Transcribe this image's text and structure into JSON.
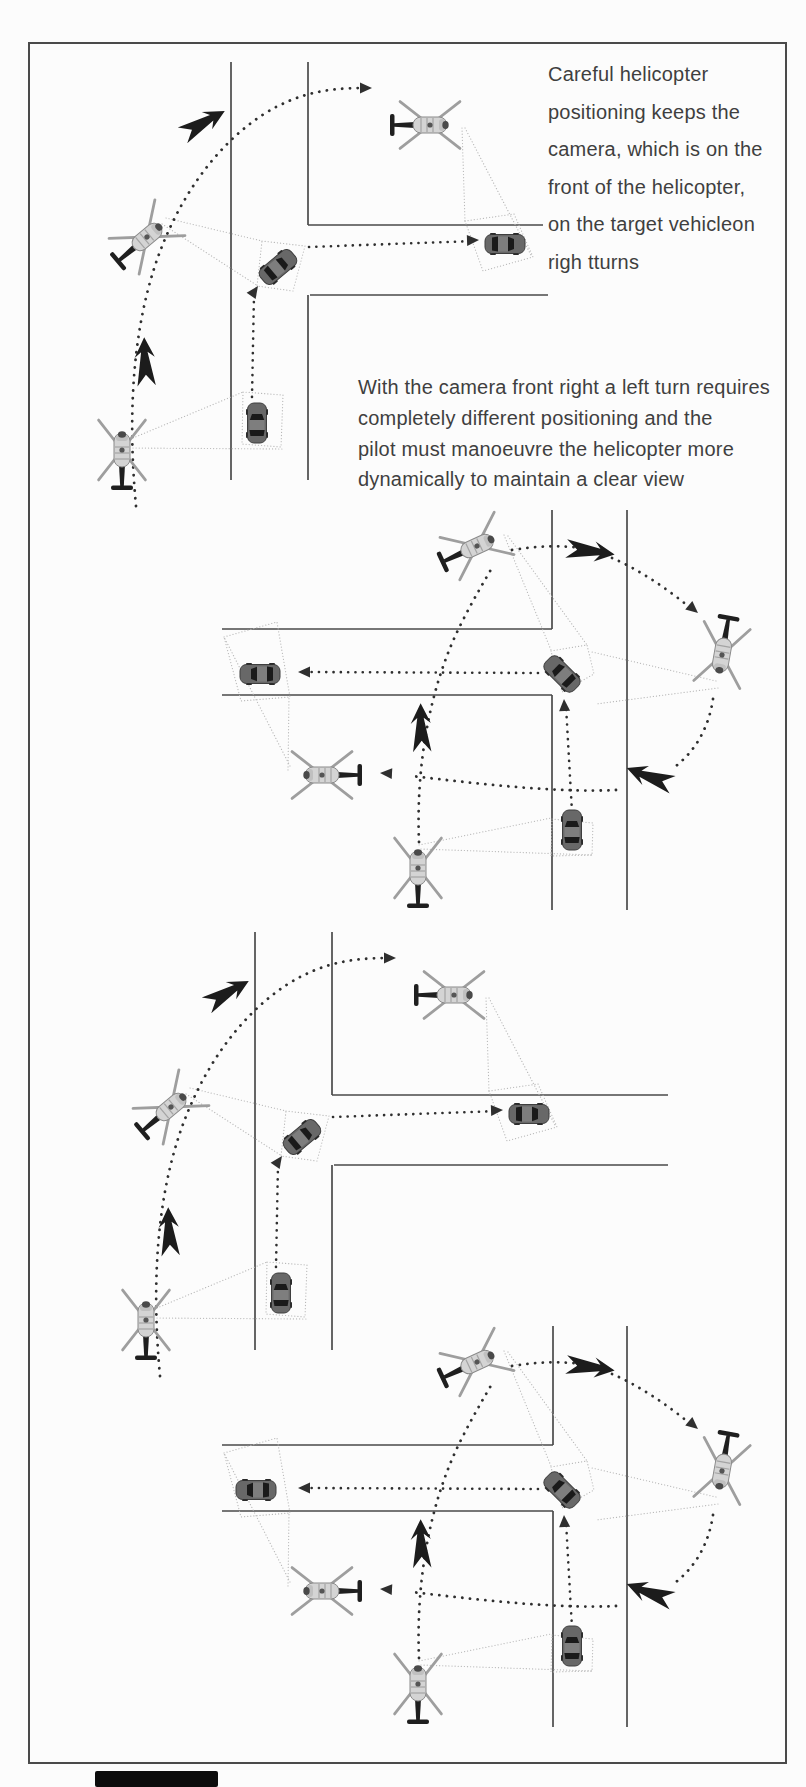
{
  "page": {
    "width": 806,
    "height": 1787,
    "background": "#fcfcfc",
    "frame_color": "#4a4a4a"
  },
  "captions": {
    "right_turn": {
      "text": "Careful helicopter\npositioning keeps the\ncamera, which is on the\nfront of the helicopter,\non the target vehicleon\nrigh tturns"
    },
    "left_turn": {
      "text": "With the camera front right a left turn requires\ncompletely different positioning and the\npilot must manoeuvre the helicopter more\ndynamically to maintain a clear view"
    }
  },
  "icons": {
    "helicopter": "helicopter-icon",
    "car": "car-icon",
    "bold_arrow": "direction-arrow",
    "arrowhead": "path-arrowhead"
  },
  "colors": {
    "road": "#4a4a4a",
    "dash": "#2f2f2f",
    "cone": "#b8b8b8",
    "bold": "#1c1c1c",
    "heli_body": "#d4d4d4",
    "heli_outline": "#8a8a8a",
    "heli_blade": "#9e9e9e",
    "heli_tail": "#1f1f1f",
    "heli_nose": "#4a4a4a",
    "car_body": "#686868",
    "car_roof": "#7e7e7e",
    "car_window": "#1a1a1a",
    "car_outline": "#3e3e3e"
  },
  "diagrams": [
    {
      "id": "right-turn-top",
      "roads": [
        [
          231,
          62,
          231,
          480
        ],
        [
          308,
          62,
          308,
          225
        ],
        [
          308,
          295,
          308,
          480
        ],
        [
          308,
          225,
          543,
          225
        ],
        [
          310,
          295,
          548,
          295
        ]
      ],
      "cone_rays": [
        [
          133,
          438,
          243,
          392
        ],
        [
          133,
          448,
          282,
          449
        ],
        [
          166,
          218,
          262,
          241
        ],
        [
          162,
          224,
          258,
          286
        ],
        [
          462,
          128,
          465,
          221
        ],
        [
          465,
          128,
          532,
          257
        ]
      ],
      "cone_quads": [
        [
          [
            243,
            392
          ],
          [
            283,
            395
          ],
          [
            281,
            447
          ],
          [
            242,
            444
          ]
        ],
        [
          [
            262,
            241
          ],
          [
            305,
            246
          ],
          [
            293,
            291
          ],
          [
            257,
            286
          ]
        ],
        [
          [
            465,
            221
          ],
          [
            514,
            214
          ],
          [
            533,
            257
          ],
          [
            483,
            271
          ]
        ]
      ],
      "vehicle_paths": [
        "M252,397 L254,294",
        "M309,247 L474,241"
      ],
      "heli_paths": [
        "M136,506 C128,420 132,340 153,272 C174,204 214,146 264,114 C302,90 336,88 366,88"
      ],
      "arrowheads": [
        {
          "x": 258,
          "y": 286,
          "rot": -55
        },
        {
          "x": 479,
          "y": 240,
          "rot": -2
        },
        {
          "x": 372,
          "y": 88,
          "rot": 0
        }
      ],
      "bold_arrows": [
        {
          "x": 145,
          "y": 362,
          "rot": -94
        },
        {
          "x": 203,
          "y": 123,
          "rot": -31
        }
      ],
      "helicopters": [
        {
          "x": 122,
          "y": 450,
          "rot": -90
        },
        {
          "x": 147,
          "y": 237,
          "rot": -40
        },
        {
          "x": 430,
          "y": 125,
          "rot": 0
        }
      ],
      "cars": [
        {
          "x": 257,
          "y": 423,
          "rot": -90
        },
        {
          "x": 278,
          "y": 267,
          "rot": -40
        },
        {
          "x": 505,
          "y": 244,
          "rot": 0
        }
      ]
    },
    {
      "id": "left-turn-top",
      "roads": [
        [
          627,
          510,
          627,
          910
        ],
        [
          552,
          510,
          552,
          629
        ],
        [
          552,
          695,
          552,
          910
        ],
        [
          222,
          629,
          552,
          629
        ],
        [
          222,
          695,
          552,
          695
        ]
      ],
      "cone_rays": [
        [
          504,
          535,
          551,
          650
        ],
        [
          508,
          536,
          587,
          645
        ],
        [
          716,
          681,
          592,
          652
        ],
        [
          718,
          688,
          596,
          704
        ],
        [
          419,
          845,
          551,
          818
        ],
        [
          421,
          849,
          593,
          855
        ],
        [
          290,
          766,
          224,
          637
        ],
        [
          288,
          770,
          289,
          697
        ]
      ],
      "cone_quads": [
        [
          [
            551,
            651
          ],
          [
            587,
            645
          ],
          [
            594,
            674
          ],
          [
            562,
            692
          ]
        ],
        [
          [
            552,
            819
          ],
          [
            593,
            823
          ],
          [
            592,
            855
          ],
          [
            551,
            856
          ]
        ],
        [
          [
            224,
            637
          ],
          [
            277,
            622
          ],
          [
            290,
            697
          ],
          [
            241,
            701
          ]
        ]
      ],
      "vehicle_paths": [
        "M572,812 L566,706",
        "M538,673 L303,672"
      ],
      "heli_paths": [
        "M419,842 C416,770 428,688 462,622 C472,602 482,585 493,566",
        "M512,550 C538,546 560,545 580,548",
        "M612,558 C638,569 666,588 688,606",
        "M713,699 C709,726 697,749 676,766",
        "M616,790 C560,793 480,784 412,776"
      ],
      "arrowheads": [
        {
          "x": 564,
          "y": 699,
          "rot": -93
        },
        {
          "x": 298,
          "y": 672,
          "rot": 180
        },
        {
          "x": 698,
          "y": 613,
          "rot": 40
        },
        {
          "x": 380,
          "y": 773,
          "rot": 183
        }
      ],
      "bold_arrows": [
        {
          "x": 590,
          "y": 551,
          "rot": 6
        },
        {
          "x": 650,
          "y": 777,
          "rot": 199
        },
        {
          "x": 421,
          "y": 728,
          "rot": -93
        }
      ],
      "helicopters": [
        {
          "x": 477,
          "y": 546,
          "rot": -25
        },
        {
          "x": 722,
          "y": 655,
          "rot": 100
        },
        {
          "x": 418,
          "y": 868,
          "rot": -90
        },
        {
          "x": 322,
          "y": 775,
          "rot": 180
        }
      ],
      "cars": [
        {
          "x": 572,
          "y": 830,
          "rot": -90
        },
        {
          "x": 562,
          "y": 674,
          "rot": -135
        },
        {
          "x": 260,
          "y": 674,
          "rot": 180
        }
      ]
    },
    {
      "id": "right-turn-bottom",
      "roads": [
        [
          255,
          932,
          255,
          1350
        ],
        [
          332,
          932,
          332,
          1095
        ],
        [
          332,
          1165,
          332,
          1350
        ],
        [
          332,
          1095,
          668,
          1095
        ],
        [
          334,
          1165,
          668,
          1165
        ]
      ],
      "cone_rays": [
        [
          157,
          1308,
          267,
          1262
        ],
        [
          157,
          1318,
          306,
          1319
        ],
        [
          190,
          1088,
          286,
          1111
        ],
        [
          186,
          1094,
          282,
          1156
        ],
        [
          486,
          998,
          489,
          1091
        ],
        [
          489,
          998,
          556,
          1127
        ]
      ],
      "cone_quads": [
        [
          [
            267,
            1262
          ],
          [
            307,
            1265
          ],
          [
            305,
            1317
          ],
          [
            266,
            1314
          ]
        ],
        [
          [
            286,
            1111
          ],
          [
            329,
            1116
          ],
          [
            317,
            1161
          ],
          [
            281,
            1156
          ]
        ],
        [
          [
            489,
            1091
          ],
          [
            538,
            1084
          ],
          [
            557,
            1127
          ],
          [
            507,
            1141
          ]
        ]
      ],
      "vehicle_paths": [
        "M276,1267 L278,1164",
        "M333,1117 L498,1111"
      ],
      "heli_paths": [
        "M160,1376 C152,1290 156,1210 177,1142 C198,1074 238,1016 288,984 C326,960 360,958 390,958"
      ],
      "arrowheads": [
        {
          "x": 282,
          "y": 1156,
          "rot": -55
        },
        {
          "x": 503,
          "y": 1110,
          "rot": -2
        },
        {
          "x": 396,
          "y": 958,
          "rot": 0
        }
      ],
      "bold_arrows": [
        {
          "x": 169,
          "y": 1232,
          "rot": -94
        },
        {
          "x": 227,
          "y": 993,
          "rot": -31
        }
      ],
      "helicopters": [
        {
          "x": 146,
          "y": 1320,
          "rot": -90
        },
        {
          "x": 171,
          "y": 1107,
          "rot": -40
        },
        {
          "x": 454,
          "y": 995,
          "rot": 0
        }
      ],
      "cars": [
        {
          "x": 281,
          "y": 1293,
          "rot": -90
        },
        {
          "x": 302,
          "y": 1137,
          "rot": -40
        },
        {
          "x": 529,
          "y": 1114,
          "rot": 0
        }
      ]
    },
    {
      "id": "left-turn-bottom",
      "roads": [
        [
          627,
          1326,
          627,
          1727
        ],
        [
          553,
          1326,
          553,
          1445
        ],
        [
          553,
          1511,
          553,
          1727
        ],
        [
          222,
          1445,
          553,
          1445
        ],
        [
          222,
          1511,
          553,
          1511
        ]
      ],
      "cone_rays": [
        [
          504,
          1351,
          551,
          1466
        ],
        [
          508,
          1352,
          587,
          1461
        ],
        [
          716,
          1497,
          592,
          1468
        ],
        [
          718,
          1504,
          596,
          1520
        ],
        [
          419,
          1661,
          551,
          1634
        ],
        [
          421,
          1665,
          593,
          1671
        ],
        [
          290,
          1582,
          224,
          1453
        ],
        [
          288,
          1586,
          289,
          1513
        ]
      ],
      "cone_quads": [
        [
          [
            551,
            1467
          ],
          [
            587,
            1461
          ],
          [
            594,
            1490
          ],
          [
            562,
            1508
          ]
        ],
        [
          [
            552,
            1635
          ],
          [
            593,
            1639
          ],
          [
            592,
            1671
          ],
          [
            551,
            1672
          ]
        ],
        [
          [
            224,
            1453
          ],
          [
            277,
            1438
          ],
          [
            290,
            1513
          ],
          [
            241,
            1517
          ]
        ]
      ],
      "vehicle_paths": [
        "M572,1628 L566,1522",
        "M538,1489 L303,1488"
      ],
      "heli_paths": [
        "M419,1658 C416,1586 428,1504 462,1438 C472,1418 482,1401 493,1382",
        "M512,1366 C538,1362 560,1361 580,1364",
        "M612,1374 C638,1385 666,1404 688,1422",
        "M713,1515 C709,1542 697,1565 676,1582",
        "M616,1606 C560,1609 480,1600 412,1592"
      ],
      "arrowheads": [
        {
          "x": 564,
          "y": 1515,
          "rot": -93
        },
        {
          "x": 298,
          "y": 1488,
          "rot": 180
        },
        {
          "x": 698,
          "y": 1429,
          "rot": 40
        },
        {
          "x": 380,
          "y": 1589,
          "rot": 183
        }
      ],
      "bold_arrows": [
        {
          "x": 590,
          "y": 1367,
          "rot": 6
        },
        {
          "x": 650,
          "y": 1593,
          "rot": 199
        },
        {
          "x": 421,
          "y": 1544,
          "rot": -93
        }
      ],
      "helicopters": [
        {
          "x": 477,
          "y": 1362,
          "rot": -25
        },
        {
          "x": 722,
          "y": 1471,
          "rot": 100
        },
        {
          "x": 418,
          "y": 1684,
          "rot": -90
        },
        {
          "x": 322,
          "y": 1591,
          "rot": 180
        }
      ],
      "cars": [
        {
          "x": 572,
          "y": 1646,
          "rot": -90
        },
        {
          "x": 562,
          "y": 1490,
          "rot": -135
        },
        {
          "x": 256,
          "y": 1490,
          "rot": 180
        }
      ]
    }
  ]
}
